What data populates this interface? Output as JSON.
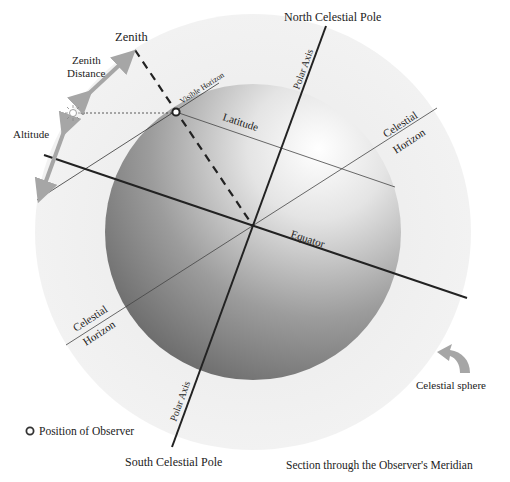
{
  "title": "Section through the Observer's Meridian",
  "labels": {
    "zenith": "Zenith",
    "zenith_distance_line1": "Zenith",
    "zenith_distance_line2": "Distance",
    "altitude": "Altitude",
    "visible_horizon": "Visible Horizon",
    "latitude": "Latitude",
    "north_celestial_pole": "North Celestial Pole",
    "south_celestial_pole": "South Celestial Pole",
    "polar_axis_top": "Polar Axis",
    "polar_axis_bottom": "Polar Axis",
    "celestial_horizon_right_line1": "Celestial",
    "celestial_horizon_right_line2": "Horizon",
    "celestial_horizon_left_line1": "Celestial",
    "celestial_horizon_left_line2": "Horizon",
    "equator": "Equator",
    "celestial_sphere": "Celestial sphere"
  },
  "legend": {
    "observer_symbol": "circle",
    "observer_label": "Position of Observer"
  },
  "colors": {
    "outer_sphere": "#eeeeee",
    "globe_dark": "#6e6e6e",
    "globe_light": "#ffffff",
    "line": "#222222",
    "arrow": "#a6a6a6"
  }
}
